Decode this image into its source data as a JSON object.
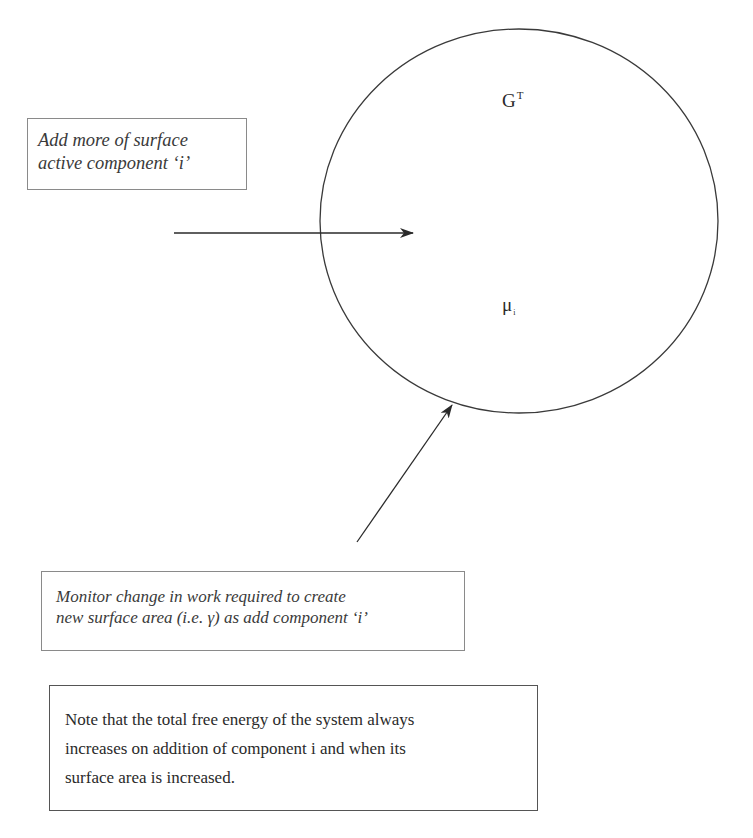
{
  "diagram": {
    "system_circle": {
      "center": [
        519,
        221
      ],
      "radius_x": 199,
      "radius_y": 192,
      "stroke": "#3a3a3a"
    },
    "labels": {
      "total_free_energy": {
        "base": "G",
        "superscript": "T"
      },
      "chemical_potential": {
        "base": "μ",
        "subscript": "i"
      }
    },
    "arrows": [
      {
        "name": "add-component-arrow",
        "from": [
          174,
          233
        ],
        "to": [
          413,
          233
        ]
      },
      {
        "name": "monitor-surface-arrow",
        "from": [
          357,
          542
        ],
        "to": [
          452,
          405
        ]
      }
    ],
    "boxes": {
      "add_component": {
        "lines": [
          "Add more of surface",
          "active component ‘i’"
        ]
      },
      "monitor": {
        "lines": [
          "Monitor change in work required to create",
          "new surface area (i.e. γ) as add component ‘i’"
        ]
      },
      "note": {
        "lines": [
          "Note that the total free energy of the system always",
          "increases on addition of component i and when its",
          "surface area is increased."
        ]
      }
    },
    "colors": {
      "line": "#2a2a2a",
      "box_border": "#8a8a8a",
      "note_border": "#555555",
      "background": "#ffffff"
    }
  }
}
